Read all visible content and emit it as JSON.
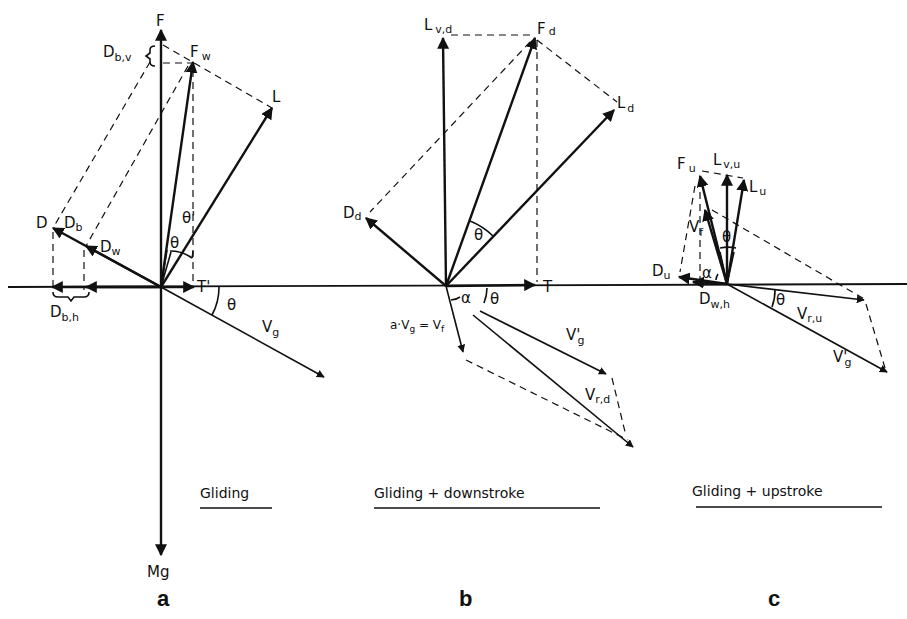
{
  "figure": {
    "panels": [
      {
        "id": "a",
        "letter": "a",
        "caption": "Gliding",
        "labels": {
          "F": "F",
          "Fw": "F",
          "Fw_sub": "w",
          "L": "L",
          "D": "D",
          "Db": "D",
          "Db_sub": "b",
          "Dw": "D",
          "Dw_sub": "w",
          "Dbv": "D",
          "Dbv_sub": "b,v",
          "Dbh": "D",
          "Dbh_sub": "b,h",
          "theta": "θ",
          "theta_prime": "θ'",
          "T_prime": "T'",
          "theta2": "θ",
          "Vg": "V",
          "Vg_sub": "g",
          "Mg": "Mg"
        }
      },
      {
        "id": "b",
        "letter": "b",
        "caption": "Gliding + downstroke",
        "labels": {
          "Lvd": "L",
          "Lvd_sub": "v,d",
          "Fd": "F",
          "Fd_sub": "d",
          "Ld": "L",
          "Ld_sub": "d",
          "Dd": "D",
          "Dd_sub": "d",
          "theta": "θ",
          "T": "T",
          "alpha": "α",
          "theta2": "θ",
          "Vf_eq": "a·V",
          "Vf_eq_sub": "g",
          "Vf_eq_rest": " = V",
          "Vf_eq_sub2": "f",
          "Vg_prime": "V'",
          "Vg_prime_sub": "g",
          "Vrd": "V",
          "Vrd_sub": "r,d"
        }
      },
      {
        "id": "c",
        "letter": "c",
        "caption": "Gliding + upstroke",
        "labels": {
          "Fu": "F",
          "Fu_sub": "u",
          "Lvu": "L",
          "Lvu_sub": "v,u",
          "Lu": "L",
          "Lu_sub": "u",
          "Vf": "V",
          "Vf_sub": "f",
          "theta": "θ",
          "Du": "D",
          "Du_sub": "u",
          "alpha": "α",
          "Dwh": "D",
          "Dwh_sub": "w,h",
          "theta2": "θ",
          "Vru": "V",
          "Vru_sub": "r,u",
          "Vg_prime": "V'",
          "Vg_prime_sub": "g"
        }
      }
    ],
    "colors": {
      "ink": "#111111",
      "background": "#ffffff"
    }
  }
}
